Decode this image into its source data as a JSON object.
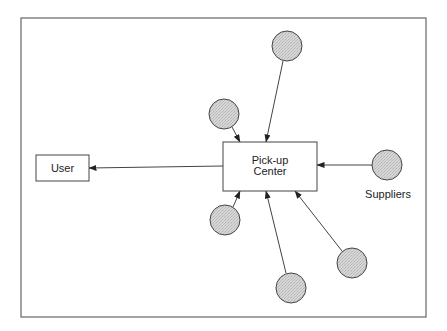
{
  "diagram": {
    "frame": {
      "x": 21,
      "y": 18,
      "width": 405,
      "height": 299
    },
    "colors": {
      "stroke": "#444444",
      "frame_stroke": "#666666",
      "supplier_fill": "#cfcfcf",
      "box_fill": "#ffffff",
      "text": "#222222"
    },
    "nodes": {
      "user": {
        "label": "User",
        "x": 36,
        "y": 155,
        "width": 53,
        "height": 26
      },
      "pickup_center": {
        "label_line1": "Pick-up",
        "label_line2": "Center",
        "x": 223,
        "y": 142,
        "width": 94,
        "height": 49
      },
      "suppliers_label": "Suppliers"
    },
    "suppliers": [
      {
        "id": "supplier-top",
        "cx": 287,
        "cy": 46,
        "r": 15
      },
      {
        "id": "supplier-upper-left",
        "cx": 224,
        "cy": 114,
        "r": 15
      },
      {
        "id": "supplier-right",
        "cx": 387,
        "cy": 165,
        "r": 15
      },
      {
        "id": "supplier-lower-left",
        "cx": 225,
        "cy": 220,
        "r": 15
      },
      {
        "id": "supplier-bottom",
        "cx": 291,
        "cy": 288,
        "r": 15
      },
      {
        "id": "supplier-lower-right",
        "cx": 352,
        "cy": 263,
        "r": 15
      }
    ],
    "edges": [
      {
        "from": "supplier-top",
        "to": "pickup_center",
        "x1": 283,
        "y1": 61,
        "x2": 266,
        "y2": 142
      },
      {
        "from": "supplier-upper-left",
        "to": "pickup_center",
        "x1": 232,
        "y1": 127,
        "x2": 240,
        "y2": 142
      },
      {
        "from": "supplier-right",
        "to": "pickup_center",
        "x1": 372,
        "y1": 165,
        "x2": 317,
        "y2": 165
      },
      {
        "from": "supplier-lower-left",
        "to": "pickup_center",
        "x1": 233,
        "y1": 207,
        "x2": 240,
        "y2": 191
      },
      {
        "from": "supplier-bottom",
        "to": "pickup_center",
        "x1": 286,
        "y1": 273,
        "x2": 266,
        "y2": 191
      },
      {
        "from": "supplier-lower-right",
        "to": "pickup_center",
        "x1": 342,
        "y1": 251,
        "x2": 295,
        "y2": 191
      },
      {
        "from": "pickup_center",
        "to": "user",
        "x1": 223,
        "y1": 166,
        "x2": 89,
        "y2": 168
      }
    ]
  }
}
